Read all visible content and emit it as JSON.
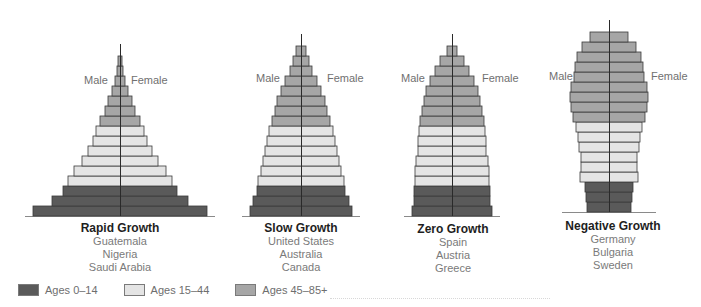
{
  "legend": [
    {
      "label": "Ages 0–14",
      "color": "#5a5a5a"
    },
    {
      "label": "Ages 15–44",
      "color": "#e4e4e4"
    },
    {
      "label": "Ages 45–85+",
      "color": "#a6a6a6"
    }
  ],
  "labels": {
    "male": "Male",
    "female": "Female"
  },
  "pyramids": [
    {
      "title": "Rapid Growth",
      "countries": [
        "Guatemala",
        "Nigeria",
        "Saudi Arabia"
      ]
    },
    {
      "title": "Slow Growth",
      "countries": [
        "United States",
        "Australia",
        "Canada"
      ]
    },
    {
      "title": "Zero Growth",
      "countries": [
        "Spain",
        "Austria",
        "Greece"
      ]
    },
    {
      "title": "Negative Growth",
      "countries": [
        "Germany",
        "Bulgaria",
        "Sweden"
      ]
    }
  ],
  "chart_data": {
    "type": "bar",
    "subtype": "population-pyramid",
    "title": "",
    "xlabel": "",
    "ylabel": "",
    "grid": false,
    "legend_position": "bottom-left",
    "note": "Values are half-bar widths in px (male = female, symmetric), ordered from the youngest cohort at the bottom to the oldest at the top. Each bar's age group is given in the band field.",
    "series": [
      {
        "name": "Rapid Growth",
        "countries": [
          "Guatemala",
          "Nigeria",
          "Saudi Arabia"
        ],
        "center_x": 120,
        "baseline_y": 216,
        "row_height": 10,
        "values": [
          87,
          68,
          57,
          52,
          46,
          38,
          32,
          27,
          24,
          20,
          15,
          12,
          8,
          5,
          3,
          2
        ],
        "band": [
          "0-14",
          "0-14",
          "0-14",
          "15-44",
          "15-44",
          "15-44",
          "15-44",
          "15-44",
          "15-44",
          "45-85+",
          "45-85+",
          "45-85+",
          "45-85+",
          "45-85+",
          "45-85+",
          "45-85+"
        ]
      },
      {
        "name": "Slow Growth",
        "countries": [
          "United States",
          "Australia",
          "Canada"
        ],
        "center_x": 301,
        "baseline_y": 216,
        "row_height": 10,
        "values": [
          51,
          48,
          44,
          43,
          40,
          38,
          36,
          34,
          32,
          29,
          26,
          24,
          20,
          16,
          11,
          8,
          5
        ],
        "band": [
          "0-14",
          "0-14",
          "0-14",
          "15-44",
          "15-44",
          "15-44",
          "15-44",
          "15-44",
          "15-44",
          "45-85+",
          "45-85+",
          "45-85+",
          "45-85+",
          "45-85+",
          "45-85+",
          "45-85+",
          "45-85+"
        ]
      },
      {
        "name": "Zero Growth",
        "countries": [
          "Spain",
          "Austria",
          "Greece"
        ],
        "center_x": 452,
        "baseline_y": 216,
        "row_height": 10,
        "values": [
          40,
          38,
          38,
          37,
          37,
          36,
          34,
          34,
          33,
          32,
          30,
          28,
          26,
          22,
          17,
          12,
          5
        ],
        "band": [
          "0-14",
          "0-14",
          "0-14",
          "15-44",
          "15-44",
          "15-44",
          "15-44",
          "15-44",
          "15-44",
          "45-85+",
          "45-85+",
          "45-85+",
          "45-85+",
          "45-85+",
          "45-85+",
          "45-85+",
          "45-85+"
        ]
      },
      {
        "name": "Negative Growth",
        "countries": [
          "Germany",
          "Bulgaria",
          "Sweden"
        ],
        "center_x": 609,
        "baseline_y": 212,
        "row_height": 10,
        "values": [
          22,
          23,
          24,
          29,
          28,
          28,
          30,
          31,
          33,
          36,
          38,
          39,
          38,
          35,
          34,
          32,
          27,
          19
        ],
        "band": [
          "0-14",
          "0-14",
          "0-14",
          "15-44",
          "15-44",
          "15-44",
          "15-44",
          "15-44",
          "15-44",
          "45-85+",
          "45-85+",
          "45-85+",
          "45-85+",
          "45-85+",
          "45-85+",
          "45-85+",
          "45-85+",
          "45-85+"
        ]
      }
    ]
  }
}
